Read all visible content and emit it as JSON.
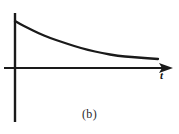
{
  "figure": {
    "caption": "(b)",
    "background_color": "#ffffff",
    "ink_color": "#1a1a1a"
  },
  "axes": {
    "x_label": "t",
    "y_label": "",
    "x_axis": {
      "x_start": 4,
      "x_end": 173,
      "y": 68
    },
    "y_axis": {
      "x": 15,
      "y_top": 13,
      "y_bottom": 122
    },
    "arrow": {
      "direction": "right",
      "tip_x": 173,
      "tip_y": 68
    }
  },
  "chart_data": {
    "type": "line",
    "title": "(b)",
    "xlabel": "t",
    "ylabel": "",
    "grid": false,
    "legend": null,
    "axis_style": "arrow-on-x-axis",
    "xlim": [
      0,
      1
    ],
    "ylim": [
      0,
      1
    ],
    "series": [
      {
        "name": "decay",
        "x": [
          0.0,
          0.05,
          0.1,
          0.15,
          0.2,
          0.25,
          0.3,
          0.35,
          0.4,
          0.5,
          0.6,
          0.7,
          0.8,
          0.9,
          1.0
        ],
        "y": [
          1.0,
          0.88,
          0.78,
          0.69,
          0.61,
          0.54,
          0.48,
          0.43,
          0.39,
          0.31,
          0.25,
          0.21,
          0.18,
          0.16,
          0.15
        ]
      }
    ],
    "curve_points_px": [
      [
        15,
        21
      ],
      [
        20,
        24
      ],
      [
        28,
        28
      ],
      [
        38,
        33
      ],
      [
        50,
        38
      ],
      [
        62,
        42
      ],
      [
        74,
        46
      ],
      [
        88,
        50
      ],
      [
        102,
        53
      ],
      [
        118,
        56
      ],
      [
        132,
        57
      ],
      [
        144,
        58
      ],
      [
        158,
        59
      ]
    ]
  }
}
